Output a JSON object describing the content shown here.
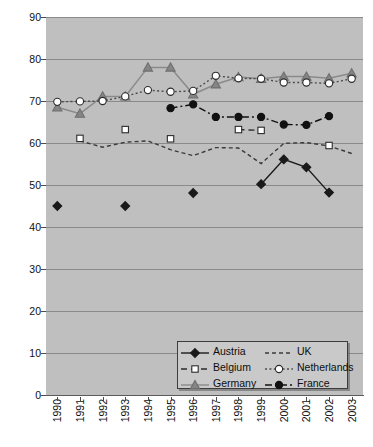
{
  "chart_data": {
    "type": "line",
    "title": "",
    "subtitle": "",
    "xlabel": "",
    "ylabel": "",
    "categories": [
      "1990",
      "1991",
      "1992",
      "1993",
      "1994",
      "1995",
      "1996",
      "1997",
      "1998",
      "1999",
      "2000",
      "2001",
      "2002",
      "2003"
    ],
    "ylim": [
      0,
      90
    ],
    "yticks": [
      0,
      10,
      20,
      30,
      40,
      50,
      60,
      70,
      80,
      90
    ],
    "grid": "horizontal",
    "legend_position": "bottom-right",
    "series": [
      {
        "name": "Austria",
        "marker": "filled-diamond",
        "color": "#1a1a1a",
        "linestyle": "solid",
        "values": [
          45,
          null,
          null,
          45,
          null,
          null,
          48.1,
          null,
          null,
          50.2,
          56.1,
          54.2,
          48.2,
          null
        ]
      },
      {
        "name": "Belgium",
        "marker": "open-square",
        "color": "#2b2b2b",
        "linestyle": "dashed",
        "values": [
          null,
          61.1,
          null,
          63.2,
          null,
          61.0,
          null,
          null,
          63.2,
          63.0,
          null,
          null,
          59.4,
          null
        ]
      },
      {
        "name": "Germany",
        "marker": "filled-triangle",
        "color": "#858585",
        "linestyle": "solid",
        "values": [
          68.5,
          67.0,
          71.1,
          71.1,
          78.0,
          78.0,
          71.6,
          74.0,
          75.7,
          75.3,
          75.8,
          75.8,
          75.4,
          76.6
        ]
      },
      {
        "name": "UK",
        "marker": "none",
        "color": "#3a3a3a",
        "linestyle": "dashed-fine",
        "values": [
          null,
          60.5,
          59.0,
          60.2,
          60.5,
          58.4,
          57.0,
          58.9,
          58.8,
          55.1,
          59.9,
          60.1,
          59.3,
          57.5
        ]
      },
      {
        "name": "Netherlands",
        "marker": "open-circle",
        "color": "#ffffff",
        "linestyle": "dotted",
        "values": [
          69.8,
          69.9,
          70.0,
          71.1,
          72.6,
          72.2,
          72.4,
          76.0,
          75.4,
          75.3,
          74.4,
          74.4,
          74.2,
          75.3
        ]
      },
      {
        "name": "France",
        "marker": "filled-circle",
        "color": "#111111",
        "linestyle": "dash-dot",
        "values": [
          null,
          null,
          null,
          null,
          null,
          68.3,
          69.2,
          66.2,
          66.2,
          66.2,
          64.4,
          64.3,
          66.4,
          null
        ]
      }
    ]
  },
  "legend": {
    "entries": [
      {
        "label": "Austria"
      },
      {
        "label": "UK"
      },
      {
        "label": "Belgium"
      },
      {
        "label": "Netherlands"
      },
      {
        "label": "Germany"
      },
      {
        "label": "France"
      }
    ]
  },
  "colors": {
    "plot_background": "#bfbfbf",
    "gridline": "#8a8a8a",
    "axis": "#4a4a4a",
    "text": "#101010",
    "germany": "#858585",
    "austria": "#1a1a1a",
    "france": "#111111"
  }
}
